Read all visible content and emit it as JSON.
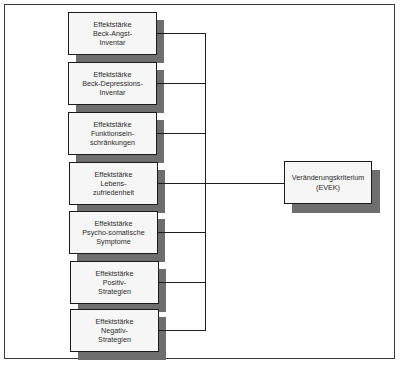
{
  "diagram": {
    "sources": [
      {
        "lines": [
          "Effektstärke",
          "Beck-Angst-",
          "Inventar"
        ]
      },
      {
        "lines": [
          "Effektstärke",
          "Beck-Depressions-",
          "Inventar"
        ]
      },
      {
        "lines": [
          "Effektstärke",
          "Funktionsein-",
          "schränkungen"
        ]
      },
      {
        "lines": [
          "Effektstärke",
          "Lebens-",
          "zufriedenheit"
        ]
      },
      {
        "lines": [
          "Effektstärke",
          "Psycho-somatische",
          "Symptome"
        ]
      },
      {
        "lines": [
          "Effektstärke",
          "Positiv-",
          "Strategien"
        ]
      },
      {
        "lines": [
          "Effektstärke",
          "Negativ-",
          "Strategien"
        ]
      }
    ],
    "target": {
      "lines": [
        "Veränderungskriterium",
        "(EVEK)"
      ]
    },
    "colors": {
      "box_fill": "#f6f6f6",
      "shadow": "#6e6e6e",
      "stroke": "#1c1c1c"
    }
  }
}
